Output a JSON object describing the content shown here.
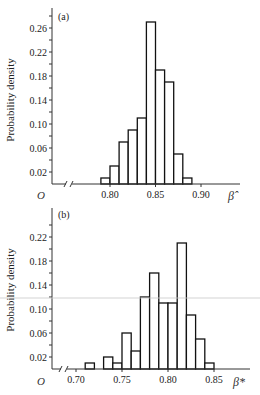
{
  "chart_data": [
    {
      "type": "bar",
      "panel_label": "(a)",
      "title": "",
      "xlabel": "β̂",
      "ylabel": "Probability density",
      "origin_label": "O",
      "axis_break": true,
      "bin_width": 0.01,
      "bin_starts": [
        0.79,
        0.8,
        0.81,
        0.82,
        0.83,
        0.84,
        0.85,
        0.86,
        0.87,
        0.88
      ],
      "values": [
        0.01,
        0.03,
        0.07,
        0.09,
        0.11,
        0.27,
        0.19,
        0.17,
        0.05,
        0.01
      ],
      "xticks": [
        "0.80",
        "0.85",
        "0.90"
      ],
      "xtick_values": [
        0.8,
        0.85,
        0.9
      ],
      "yticks": [
        "0.02",
        "0.06",
        "0.10",
        "0.14",
        "0.18",
        "0.22",
        "0.26"
      ],
      "ytick_values": [
        0.02,
        0.06,
        0.1,
        0.14,
        0.18,
        0.22,
        0.26
      ],
      "xlim": [
        0.755,
        0.955
      ],
      "ylim": [
        0,
        0.29
      ],
      "grid": false
    },
    {
      "type": "bar",
      "panel_label": "(b)",
      "title": "",
      "xlabel": "β*",
      "ylabel": "Probability density",
      "origin_label": "O",
      "axis_break": true,
      "bin_width": 0.01,
      "bin_starts": [
        0.71,
        0.73,
        0.74,
        0.75,
        0.76,
        0.77,
        0.78,
        0.79,
        0.8,
        0.81,
        0.82,
        0.83,
        0.84
      ],
      "values": [
        0.01,
        0.02,
        0.01,
        0.06,
        0.03,
        0.12,
        0.16,
        0.11,
        0.11,
        0.21,
        0.09,
        0.05,
        0.01
      ],
      "xticks": [
        "0.70",
        "0.75",
        "0.80",
        "0.85"
      ],
      "xtick_values": [
        0.7,
        0.75,
        0.8,
        0.85
      ],
      "yticks": [
        "0.02",
        "0.06",
        "0.10",
        "0.14",
        "0.18",
        "0.22"
      ],
      "ytick_values": [
        0.02,
        0.06,
        0.1,
        0.14,
        0.18,
        0.22
      ],
      "xlim": [
        0.665,
        0.895
      ],
      "ylim": [
        0,
        0.25
      ],
      "grid": false
    }
  ]
}
